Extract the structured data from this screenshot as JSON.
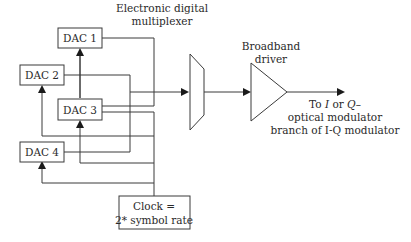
{
  "diagram": {
    "type": "block-diagram",
    "title": "",
    "blocks": {
      "dac1": {
        "label": "DAC 1"
      },
      "dac2": {
        "label": "DAC 2"
      },
      "dac3": {
        "label": "DAC 3"
      },
      "dac4": {
        "label": "DAC 4"
      },
      "clock": {
        "line1": "Clock =",
        "line2": "2* symbol rate"
      },
      "mux": {
        "line1": "Electronic digital",
        "line2": "multiplexer"
      },
      "driver": {
        "line1": "Broadband",
        "line2": "driver"
      }
    },
    "output": {
      "line1_prefix": "To ",
      "line1_i": "I",
      "line1_mid": " or ",
      "line1_q": "Q",
      "line1_suffix": "–",
      "line2": "optical modulator",
      "line3": "branch of I-Q modulator"
    },
    "connections": [
      {
        "from": "DAC 1",
        "to": "Electronic digital multiplexer"
      },
      {
        "from": "DAC 3",
        "to": "Electronic digital multiplexer"
      },
      {
        "from": "DAC 2",
        "to": "Electronic digital multiplexer"
      },
      {
        "from": "DAC 4",
        "to": "Electronic digital multiplexer"
      },
      {
        "from": "Clock = 2* symbol rate",
        "to": "DAC 1"
      },
      {
        "from": "Clock = 2* symbol rate",
        "to": "DAC 2"
      },
      {
        "from": "Clock = 2* symbol rate",
        "to": "DAC 3"
      },
      {
        "from": "Clock = 2* symbol rate",
        "to": "DAC 4"
      },
      {
        "from": "Electronic digital multiplexer",
        "to": "Broadband driver"
      },
      {
        "from": "Broadband driver",
        "to": "To I or Q– optical modulator branch of I-Q modulator"
      }
    ]
  }
}
